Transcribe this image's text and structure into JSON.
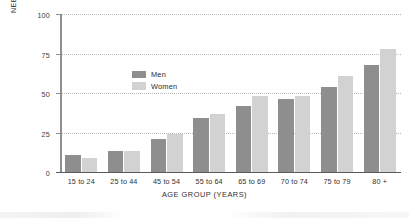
{
  "chart_data": {
    "type": "bar",
    "title": "",
    "xlabel": "AGE GROUP (YEARS)",
    "ylabel_line1": "PERCENTAGE",
    "ylabel_line2": "NEEDING IADL ASSISTANCE",
    "categories": [
      "15 to 24",
      "25 to 44",
      "45 to 54",
      "55 to 64",
      "65 to 69",
      "70 to 74",
      "75 to 79",
      "80 +"
    ],
    "series": [
      {
        "name": "Men",
        "color": "#8e8e8e",
        "values": [
          11,
          13,
          21,
          34,
          42,
          46,
          54,
          68
        ]
      },
      {
        "name": "Women",
        "color": "#d2d2d2",
        "values": [
          9,
          13,
          24,
          37,
          48,
          48,
          61,
          78
        ]
      }
    ],
    "ylim": [
      0,
      100
    ],
    "yticks": [
      0,
      25,
      50,
      75,
      100
    ],
    "ytick_labels": [
      "0",
      "25",
      "50",
      "75",
      "100"
    ],
    "grid": true,
    "grid_style": "dotted-horizontal",
    "legend_position": "upper-left-inside"
  },
  "legend": {
    "items": [
      {
        "label": "Men",
        "color": "#8e8e8e"
      },
      {
        "label": "Women",
        "color": "#d2d2d2"
      }
    ]
  },
  "axes": {
    "x_title": "AGE GROUP (YEARS)",
    "y_title_line1": "PERCENTAGE",
    "y_title_line2": "NEEDING IADL ASSISTANCE"
  }
}
